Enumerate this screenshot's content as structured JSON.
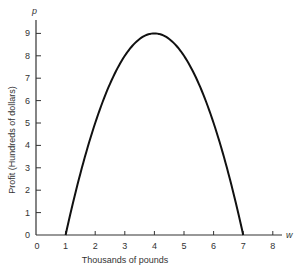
{
  "chart_data": {
    "type": "line",
    "title": "",
    "xlabel": "Thousands of pounds",
    "ylabel": "Profit (Hundreds of dollars)",
    "x_axis_symbol": "w",
    "y_axis_symbol": "p",
    "xlim": [
      0,
      8.5
    ],
    "ylim": [
      0,
      9.6
    ],
    "x_ticks": [
      0,
      1,
      2,
      3,
      4,
      5,
      6,
      7,
      8
    ],
    "y_ticks": [
      0,
      1,
      2,
      3,
      4,
      5,
      6,
      7,
      8,
      9
    ],
    "grid": false,
    "legend": null,
    "series": [
      {
        "name": "profit",
        "equation": "p = -w^2 + 8w - 7",
        "x": [
          1,
          1.5,
          2,
          2.5,
          3,
          3.5,
          4,
          4.5,
          5,
          5.5,
          6,
          6.5,
          7
        ],
        "y": [
          0,
          3.25,
          5,
          6.75,
          8,
          8.75,
          9,
          8.75,
          8,
          6.75,
          5,
          3.25,
          0
        ]
      }
    ],
    "annotations": {
      "zeros": [
        1,
        7
      ],
      "maximum": {
        "x": 4,
        "y": 9
      }
    }
  },
  "colors": {
    "line": "#111111",
    "axis": "#333333",
    "text": "#333333"
  }
}
